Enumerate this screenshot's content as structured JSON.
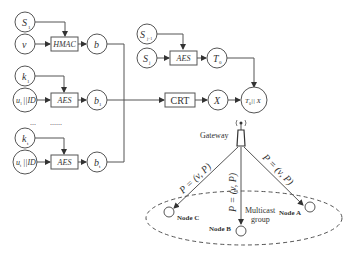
{
  "diagram": {
    "type": "flow",
    "inputs": {
      "s1": {
        "base": "S",
        "sub": "1"
      },
      "v": {
        "base": "v"
      },
      "k1": {
        "base": "k",
        "sub": "1"
      },
      "u1id": {
        "base": "u",
        "sub": "1",
        "suffix": "||ID"
      },
      "kt": {
        "base": "k",
        "sub": "t"
      },
      "utid": {
        "base": "u",
        "sub": "t",
        "suffix": "||ID"
      },
      "sj1": {
        "base": "S",
        "sub": "j−1"
      },
      "sj": {
        "base": "S",
        "sub": "j"
      }
    },
    "ellipsis": {
      "left": "...",
      "right": "......"
    },
    "boxes": {
      "hmac": "HMAC",
      "aes1": "AES",
      "aes2": "AES",
      "aes3": "AES",
      "crt": "CRT"
    },
    "outputs": {
      "b": {
        "base": "b"
      },
      "b1": {
        "base": "b",
        "sub": "1"
      },
      "bt": {
        "base": "b",
        "sub": "t"
      },
      "T0": {
        "base": "T",
        "sub": "0"
      },
      "X": {
        "base": "X"
      },
      "final": {
        "base": "T",
        "sub": "0",
        "suffix": " || X"
      }
    },
    "gateway": {
      "label": "Gateway"
    },
    "edges": {
      "to_c": "P = (v, P)",
      "to_b": "P = (v, P)",
      "to_a": "P = (v, P)"
    },
    "group": {
      "line1": "Multicast",
      "line2": "group"
    },
    "nodes": {
      "a": "Node A",
      "b": "Node B",
      "c": "Node C"
    }
  }
}
